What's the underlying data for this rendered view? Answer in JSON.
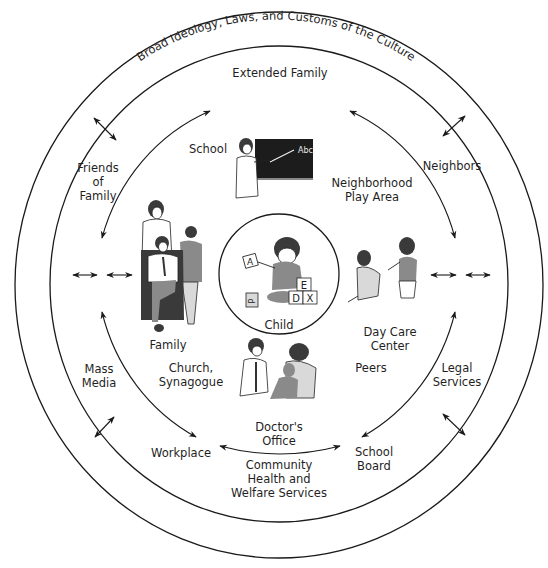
{
  "diagram": {
    "rings": {
      "outer_label": "Broad Ideology, Laws, and Customs of the Culture",
      "second_label": "Extended Family",
      "center_label": "Child"
    },
    "microsystem": {
      "school": "School",
      "neighborhood_line1": "Neighborhood",
      "neighborhood_line2": "Play Area",
      "family": "Family",
      "day_care_line1": "Day Care",
      "day_care_line2": "Center",
      "church_line1": "Church,",
      "church_line2": "Synagogue",
      "peers": "Peers",
      "doctor_line1": "Doctor's",
      "doctor_line2": "Office"
    },
    "exosystem": {
      "friends_line1": "Friends",
      "friends_line2": "of",
      "friends_line3": "Family",
      "neighbors": "Neighbors",
      "mass_media_line1": "Mass",
      "mass_media_line2": "Media",
      "legal_line1": "Legal",
      "legal_line2": "Services",
      "workplace": "Workplace",
      "school_board_line1": "School",
      "school_board_line2": "Board",
      "community_line1": "Community",
      "community_line2": "Health and",
      "community_line3": "Welfare Services"
    },
    "blocks": [
      "A",
      "E",
      "D",
      "X",
      "P"
    ],
    "chalkboard_text": "Abc",
    "colors": {
      "line": "#1a1a1a",
      "text": "#1f1f1f",
      "background": "#ffffff",
      "chalkboard": "#1c1c1c"
    }
  }
}
